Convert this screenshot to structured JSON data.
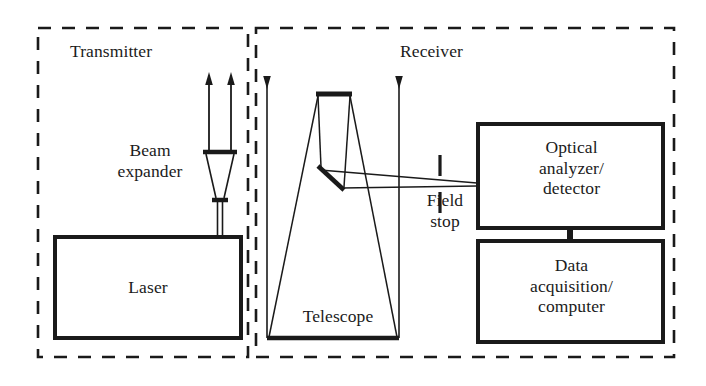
{
  "diagram": {
    "background_color": "#ffffff",
    "line_color": "#1a1a1a",
    "sections": [
      {
        "id": "transmitter",
        "label": "Transmitter",
        "border_style": "dashed"
      },
      {
        "id": "receiver",
        "label": "Receiver",
        "border_style": "dashed"
      }
    ],
    "boxes": [
      {
        "id": "laser",
        "label": "Laser",
        "section": "transmitter"
      },
      {
        "id": "optical-analyzer",
        "label": "Optical\nanalyzer/\ndetector",
        "section": "receiver"
      },
      {
        "id": "data-acquisition",
        "label": "Data\nacquisition/\ncomputer",
        "section": "receiver"
      }
    ],
    "component_labels": [
      {
        "id": "beam-expander",
        "label": "Beam\nexpander",
        "section": "transmitter"
      },
      {
        "id": "telescope",
        "label": "Telescope",
        "section": "receiver"
      },
      {
        "id": "field-stop",
        "label": "Field\nstop",
        "section": "receiver"
      }
    ],
    "beams": [
      {
        "id": "transmitted-beam-left",
        "direction": "up",
        "description": "outgoing expanded laser beam left edge"
      },
      {
        "id": "transmitted-beam-right",
        "direction": "up",
        "description": "outgoing expanded laser beam right edge"
      },
      {
        "id": "returned-beam",
        "direction": "down",
        "description": "backscattered return signal into telescope"
      }
    ],
    "optics": [
      {
        "id": "beam-expander-output-lens",
        "type": "lens"
      },
      {
        "id": "beam-expander-input-lens",
        "type": "lens"
      },
      {
        "id": "telescope-primary-mirror",
        "type": "mirror"
      },
      {
        "id": "telescope-secondary-mirror",
        "type": "mirror"
      },
      {
        "id": "telescope-fold-mirror",
        "type": "mirror"
      },
      {
        "id": "field-stop-aperture",
        "type": "aperture"
      }
    ]
  }
}
